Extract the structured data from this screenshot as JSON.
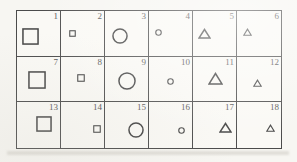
{
  "figure": {
    "colors": {
      "paper": "#f7f6f2",
      "table_background": "#faf9f5",
      "line": "#4b4b4b",
      "shape_stroke": "#474747",
      "number_text": "#565656",
      "scan_shadow": "#d9d7d0"
    },
    "grid": {
      "columns": 6,
      "rows": 3,
      "cell_count": 18
    },
    "cells": [
      {
        "number": "1",
        "shape": "square",
        "size": "large",
        "w": 17,
        "h": 17,
        "x": 5,
        "y": 17
      },
      {
        "number": "2",
        "shape": "square",
        "size": "small",
        "w": 7,
        "h": 7,
        "x": 8,
        "y": 19
      },
      {
        "number": "3",
        "shape": "circle",
        "size": "large",
        "w": 16,
        "h": 16,
        "x": 7,
        "y": 17
      },
      {
        "number": "4",
        "shape": "circle",
        "size": "small",
        "w": 7,
        "h": 7,
        "x": 6,
        "y": 18
      },
      {
        "number": "5",
        "shape": "triangle",
        "size": "large",
        "w": 13,
        "h": 11,
        "x": 5,
        "y": 17
      },
      {
        "number": "6",
        "shape": "triangle",
        "size": "small",
        "w": 9,
        "h": 8,
        "x": 6,
        "y": 17
      },
      {
        "number": "7",
        "shape": "square",
        "size": "large",
        "w": 18,
        "h": 18,
        "x": 11,
        "y": 14
      },
      {
        "number": "8",
        "shape": "square",
        "size": "small",
        "w": 8,
        "h": 8,
        "x": 16,
        "y": 17
      },
      {
        "number": "9",
        "shape": "circle",
        "size": "large",
        "w": 18,
        "h": 18,
        "x": 13,
        "y": 15
      },
      {
        "number": "10",
        "shape": "circle",
        "size": "small",
        "w": 7,
        "h": 7,
        "x": 18,
        "y": 21
      },
      {
        "number": "11",
        "shape": "triangle",
        "size": "large",
        "w": 15,
        "h": 13,
        "x": 15,
        "y": 15
      },
      {
        "number": "12",
        "shape": "triangle",
        "size": "small",
        "w": 9,
        "h": 8,
        "x": 16,
        "y": 22
      },
      {
        "number": "13",
        "shape": "square",
        "size": "large",
        "w": 16,
        "h": 16,
        "x": 19,
        "y": 14
      },
      {
        "number": "14",
        "shape": "square",
        "size": "small",
        "w": 8,
        "h": 8,
        "x": 32,
        "y": 23
      },
      {
        "number": "15",
        "shape": "circle",
        "size": "large",
        "w": 16,
        "h": 16,
        "x": 23,
        "y": 20
      },
      {
        "number": "16",
        "shape": "circle",
        "size": "small",
        "w": 7,
        "h": 7,
        "x": 29,
        "y": 25
      },
      {
        "number": "17",
        "shape": "triangle",
        "size": "large",
        "w": 13,
        "h": 11,
        "x": 26,
        "y": 20
      },
      {
        "number": "18",
        "shape": "triangle",
        "size": "small",
        "w": 9,
        "h": 8,
        "x": 29,
        "y": 22
      }
    ]
  }
}
